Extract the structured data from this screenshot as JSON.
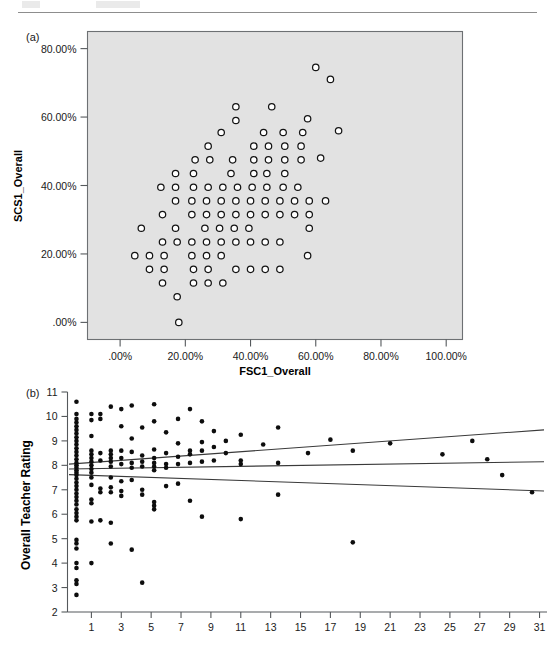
{
  "page": {
    "header_rule_visible": true,
    "header_text_left": "",
    "header_text_mid": ""
  },
  "panel_a": {
    "tag": "(a)",
    "xlabel": "FSC1_Overall",
    "ylabel": "SCS1_Overall",
    "xticks": [
      ".00%",
      "20.00%",
      "40.00%",
      "60.00%",
      "80.00%",
      "100.00%"
    ],
    "yticks": [
      ".00%",
      "20.00%",
      "40.00%",
      "60.00%",
      "80.00%"
    ],
    "plot_bg_color": "#e2e2e2",
    "marker": "open-circle"
  },
  "panel_b": {
    "tag": "(b)",
    "ylabel": "Overall Teacher Rating",
    "xticks": [
      "1",
      "3",
      "5",
      "7",
      "9",
      "11",
      "13",
      "15",
      "17",
      "19",
      "21",
      "23",
      "25",
      "27",
      "29",
      "31"
    ],
    "yticks": [
      "2",
      "3",
      "4",
      "5",
      "6",
      "7",
      "8",
      "9",
      "10",
      "11"
    ],
    "marker": "filled-dot",
    "line_color": "#3a3a3a"
  },
  "chart_data": [
    {
      "type": "scatter",
      "panel": "a",
      "title": "",
      "xlabel": "FSC1_Overall",
      "ylabel": "SCS1_Overall",
      "xlim": [
        -10,
        105
      ],
      "ylim": [
        -5,
        85
      ],
      "xticks": [
        0,
        20,
        40,
        60,
        80,
        100
      ],
      "yticks": [
        0,
        20,
        40,
        60,
        80
      ],
      "xticklabels": [
        ".00%",
        "20.00%",
        "40.00%",
        "60.00%",
        "80.00%",
        "100.00%"
      ],
      "yticklabels": [
        ".00%",
        "20.00%",
        "40.00%",
        "60.00%",
        "80.00%"
      ],
      "grid": false,
      "legend": false,
      "marker": "o",
      "marker_filled": false,
      "points": [
        [
          60.0,
          74.5
        ],
        [
          64.5,
          71.0
        ],
        [
          35.5,
          63.0
        ],
        [
          46.5,
          63.0
        ],
        [
          35.5,
          59.0
        ],
        [
          57.5,
          59.5
        ],
        [
          67.0,
          56.0
        ],
        [
          31.0,
          55.5
        ],
        [
          44.0,
          55.5
        ],
        [
          50.0,
          55.5
        ],
        [
          56.0,
          55.5
        ],
        [
          27.0,
          51.5
        ],
        [
          41.0,
          51.5
        ],
        [
          45.5,
          51.5
        ],
        [
          50.5,
          51.5
        ],
        [
          55.5,
          51.5
        ],
        [
          61.5,
          48.0
        ],
        [
          23.0,
          47.5
        ],
        [
          27.5,
          47.5
        ],
        [
          34.5,
          47.5
        ],
        [
          41.0,
          47.5
        ],
        [
          45.5,
          47.5
        ],
        [
          50.5,
          47.5
        ],
        [
          55.5,
          47.5
        ],
        [
          17.0,
          43.5
        ],
        [
          22.5,
          43.5
        ],
        [
          34.0,
          43.5
        ],
        [
          41.0,
          43.5
        ],
        [
          45.0,
          43.5
        ],
        [
          50.5,
          43.5
        ],
        [
          12.5,
          39.5
        ],
        [
          17.0,
          39.5
        ],
        [
          22.5,
          39.5
        ],
        [
          27.0,
          39.5
        ],
        [
          31.5,
          39.5
        ],
        [
          36.0,
          39.5
        ],
        [
          40.5,
          39.5
        ],
        [
          45.0,
          39.5
        ],
        [
          50.0,
          39.5
        ],
        [
          54.5,
          39.5
        ],
        [
          17.0,
          35.5
        ],
        [
          22.0,
          35.5
        ],
        [
          26.5,
          35.5
        ],
        [
          31.0,
          35.5
        ],
        [
          35.5,
          35.5
        ],
        [
          40.0,
          35.5
        ],
        [
          44.5,
          35.5
        ],
        [
          49.0,
          35.5
        ],
        [
          53.5,
          35.5
        ],
        [
          58.0,
          35.5
        ],
        [
          63.0,
          35.5
        ],
        [
          13.0,
          31.5
        ],
        [
          22.0,
          31.5
        ],
        [
          26.5,
          31.5
        ],
        [
          31.0,
          31.5
        ],
        [
          35.5,
          31.5
        ],
        [
          40.0,
          31.5
        ],
        [
          44.5,
          31.5
        ],
        [
          49.0,
          31.5
        ],
        [
          53.5,
          31.5
        ],
        [
          58.0,
          31.5
        ],
        [
          6.5,
          27.5
        ],
        [
          17.0,
          27.5
        ],
        [
          26.0,
          27.5
        ],
        [
          30.5,
          27.5
        ],
        [
          35.0,
          27.5
        ],
        [
          39.5,
          27.5
        ],
        [
          58.0,
          27.5
        ],
        [
          13.0,
          23.5
        ],
        [
          17.5,
          23.5
        ],
        [
          22.0,
          23.5
        ],
        [
          26.5,
          23.5
        ],
        [
          31.0,
          23.5
        ],
        [
          35.5,
          23.5
        ],
        [
          40.0,
          23.5
        ],
        [
          44.5,
          23.5
        ],
        [
          49.0,
          23.5
        ],
        [
          4.5,
          19.5
        ],
        [
          9.0,
          19.5
        ],
        [
          13.5,
          19.5
        ],
        [
          22.0,
          19.5
        ],
        [
          26.5,
          19.5
        ],
        [
          31.0,
          19.5
        ],
        [
          57.5,
          19.5
        ],
        [
          9.0,
          15.5
        ],
        [
          13.5,
          15.5
        ],
        [
          22.5,
          15.5
        ],
        [
          27.0,
          15.5
        ],
        [
          35.5,
          15.5
        ],
        [
          40.0,
          15.5
        ],
        [
          44.5,
          15.5
        ],
        [
          49.0,
          15.5
        ],
        [
          13.0,
          11.5
        ],
        [
          22.5,
          11.5
        ],
        [
          27.0,
          11.5
        ],
        [
          31.5,
          11.5
        ],
        [
          17.5,
          7.5
        ],
        [
          18.0,
          0.0
        ]
      ]
    },
    {
      "type": "scatter",
      "panel": "b",
      "title": "",
      "xlabel": "",
      "ylabel": "Overall Teacher Rating",
      "xlim": [
        -0.6,
        31.5
      ],
      "ylim": [
        2,
        11
      ],
      "xticks": [
        1,
        3,
        5,
        7,
        9,
        11,
        13,
        15,
        17,
        19,
        21,
        23,
        25,
        27,
        29,
        31
      ],
      "yticks": [
        2,
        3,
        4,
        5,
        6,
        7,
        8,
        9,
        10,
        11
      ],
      "grid": false,
      "legend": false,
      "marker": ".",
      "marker_filled": true,
      "annotations": [
        "regression line with upper and lower confidence bands"
      ],
      "series": [
        {
          "name": "regression-fit",
          "kind": "line",
          "x": [
            -0.5,
            31.3
          ],
          "y": [
            7.85,
            8.15
          ]
        },
        {
          "name": "upper-confidence-band",
          "kind": "line",
          "x": [
            -0.5,
            31.3
          ],
          "y": [
            8.05,
            9.45
          ]
        },
        {
          "name": "lower-confidence-band",
          "kind": "line",
          "x": [
            -0.5,
            31.3
          ],
          "y": [
            7.62,
            6.95
          ]
        }
      ],
      "points": [
        [
          0.0,
          10.6
        ],
        [
          0.0,
          10.1
        ],
        [
          0.0,
          9.9
        ],
        [
          0.0,
          9.75
        ],
        [
          0.0,
          9.6
        ],
        [
          0.0,
          9.45
        ],
        [
          0.0,
          9.3
        ],
        [
          0.0,
          9.15
        ],
        [
          0.0,
          9.0
        ],
        [
          0.0,
          8.85
        ],
        [
          0.0,
          8.7
        ],
        [
          0.0,
          8.55
        ],
        [
          0.0,
          8.4
        ],
        [
          0.0,
          8.25
        ],
        [
          0.0,
          8.1
        ],
        [
          0.0,
          8.0
        ],
        [
          0.0,
          7.9
        ],
        [
          0.0,
          7.8
        ],
        [
          0.0,
          7.7
        ],
        [
          0.0,
          7.6
        ],
        [
          0.0,
          7.45
        ],
        [
          0.0,
          7.3
        ],
        [
          0.0,
          7.15
        ],
        [
          0.0,
          7.0
        ],
        [
          0.0,
          6.85
        ],
        [
          0.0,
          6.7
        ],
        [
          0.0,
          6.55
        ],
        [
          0.0,
          6.4
        ],
        [
          0.0,
          6.2
        ],
        [
          0.0,
          6.05
        ],
        [
          0.0,
          5.9
        ],
        [
          0.0,
          5.75
        ],
        [
          0.0,
          4.95
        ],
        [
          0.0,
          4.8
        ],
        [
          0.0,
          4.6
        ],
        [
          0.0,
          4.0
        ],
        [
          0.0,
          3.8
        ],
        [
          0.0,
          3.3
        ],
        [
          0.0,
          3.15
        ],
        [
          0.0,
          2.7
        ],
        [
          1.0,
          10.1
        ],
        [
          1.0,
          9.85
        ],
        [
          1.0,
          9.2
        ],
        [
          1.0,
          8.6
        ],
        [
          1.0,
          8.45
        ],
        [
          1.0,
          8.3
        ],
        [
          1.0,
          8.15
        ],
        [
          1.0,
          8.0
        ],
        [
          1.0,
          7.85
        ],
        [
          1.0,
          7.7
        ],
        [
          1.0,
          7.5
        ],
        [
          1.0,
          7.2
        ],
        [
          1.0,
          6.6
        ],
        [
          1.0,
          6.45
        ],
        [
          1.0,
          5.7
        ],
        [
          1.0,
          4.0
        ],
        [
          1.6,
          10.1
        ],
        [
          1.6,
          9.9
        ],
        [
          1.6,
          8.5
        ],
        [
          1.6,
          8.2
        ],
        [
          1.6,
          7.05
        ],
        [
          1.6,
          6.9
        ],
        [
          1.6,
          5.75
        ],
        [
          2.3,
          10.4
        ],
        [
          2.3,
          8.6
        ],
        [
          2.3,
          8.45
        ],
        [
          2.3,
          8.3
        ],
        [
          2.3,
          8.15
        ],
        [
          2.3,
          7.95
        ],
        [
          2.3,
          7.5
        ],
        [
          2.3,
          7.1
        ],
        [
          2.3,
          6.9
        ],
        [
          2.3,
          5.65
        ],
        [
          2.3,
          4.8
        ],
        [
          3.0,
          10.3
        ],
        [
          3.0,
          9.6
        ],
        [
          3.0,
          8.6
        ],
        [
          3.0,
          8.3
        ],
        [
          3.0,
          8.05
        ],
        [
          3.0,
          7.35
        ],
        [
          3.0,
          6.95
        ],
        [
          3.0,
          6.75
        ],
        [
          3.7,
          10.45
        ],
        [
          3.7,
          9.1
        ],
        [
          3.7,
          8.55
        ],
        [
          3.7,
          8.1
        ],
        [
          3.7,
          7.9
        ],
        [
          3.7,
          7.4
        ],
        [
          3.7,
          4.55
        ],
        [
          4.4,
          9.55
        ],
        [
          4.4,
          8.4
        ],
        [
          4.4,
          8.15
        ],
        [
          4.4,
          7.95
        ],
        [
          4.4,
          7.0
        ],
        [
          4.4,
          6.8
        ],
        [
          4.4,
          3.2
        ],
        [
          5.2,
          10.5
        ],
        [
          5.2,
          9.8
        ],
        [
          5.2,
          8.65
        ],
        [
          5.2,
          8.3
        ],
        [
          5.2,
          8.1
        ],
        [
          5.2,
          7.95
        ],
        [
          5.2,
          7.8
        ],
        [
          5.2,
          6.5
        ],
        [
          5.2,
          6.35
        ],
        [
          5.2,
          6.2
        ],
        [
          6.0,
          9.35
        ],
        [
          6.0,
          8.5
        ],
        [
          6.0,
          8.05
        ],
        [
          6.0,
          7.9
        ],
        [
          6.0,
          7.15
        ],
        [
          6.8,
          9.9
        ],
        [
          6.8,
          8.9
        ],
        [
          6.8,
          8.35
        ],
        [
          6.8,
          8.05
        ],
        [
          6.8,
          7.25
        ],
        [
          7.6,
          10.3
        ],
        [
          7.6,
          8.6
        ],
        [
          7.6,
          8.45
        ],
        [
          7.6,
          8.1
        ],
        [
          7.6,
          6.55
        ],
        [
          8.4,
          9.8
        ],
        [
          8.4,
          8.95
        ],
        [
          8.4,
          8.6
        ],
        [
          8.4,
          8.15
        ],
        [
          8.4,
          5.9
        ],
        [
          9.2,
          9.4
        ],
        [
          9.2,
          8.75
        ],
        [
          9.2,
          8.2
        ],
        [
          10.0,
          9.0
        ],
        [
          10.0,
          8.5
        ],
        [
          11.0,
          9.25
        ],
        [
          11.0,
          8.2
        ],
        [
          11.0,
          8.05
        ],
        [
          11.0,
          5.8
        ],
        [
          12.5,
          8.85
        ],
        [
          13.5,
          9.55
        ],
        [
          13.5,
          8.1
        ],
        [
          13.5,
          6.8
        ],
        [
          15.5,
          8.5
        ],
        [
          17.0,
          9.05
        ],
        [
          18.5,
          8.6
        ],
        [
          18.5,
          4.85
        ],
        [
          21.0,
          8.9
        ],
        [
          24.5,
          8.45
        ],
        [
          26.5,
          9.0
        ],
        [
          27.5,
          8.25
        ],
        [
          28.5,
          7.6
        ],
        [
          30.5,
          6.9
        ]
      ]
    }
  ]
}
